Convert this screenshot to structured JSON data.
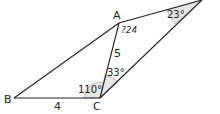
{
  "diagram": {
    "title": "",
    "points": [
      {
        "id": "A",
        "label": "A",
        "x": 119,
        "y": 23
      },
      {
        "id": "B",
        "label": "B",
        "x": 14,
        "y": 98
      },
      {
        "id": "C",
        "label": "C",
        "x": 100,
        "y": 98
      },
      {
        "id": "D",
        "label": "",
        "x": 202,
        "y": 0
      }
    ],
    "segments": [
      {
        "from": "B",
        "to": "C",
        "label": "4"
      },
      {
        "from": "C",
        "to": "A",
        "label": "5"
      },
      {
        "from": "A",
        "to": "B",
        "label": ""
      },
      {
        "from": "A",
        "to": "D",
        "label": ""
      },
      {
        "from": "C",
        "to": "D",
        "label": ""
      }
    ],
    "angles": [
      {
        "vertex": "C",
        "between": [
          "B",
          "A"
        ],
        "label": "110°"
      },
      {
        "vertex": "C",
        "between": [
          "A",
          "D"
        ],
        "label": "33°"
      },
      {
        "vertex": "D",
        "between": [
          "A",
          "C"
        ],
        "label": "23°"
      }
    ],
    "annotations": [
      {
        "text": "?24",
        "near": "A"
      }
    ],
    "colors": {
      "line": "#222222",
      "angle_fill": "#e6e6e6"
    }
  }
}
